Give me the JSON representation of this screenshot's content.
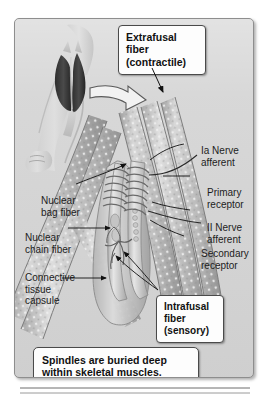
{
  "figure": {
    "background_color": "#d6d6d6",
    "page_color": "#ffffff",
    "border_color": "#8e8e8e"
  },
  "callouts": {
    "extrafusal": {
      "line1": "Extrafusal",
      "line2": "fiber",
      "line3": "(contractile)"
    },
    "intrafusal": {
      "line1": "Intrafusal",
      "line2": "fiber",
      "line3": "(sensory)"
    },
    "caption": {
      "line1": "Spindles are buried deep",
      "line2": "within skeletal muscles."
    }
  },
  "labels": {
    "ia_nerve": {
      "line1": "Ia Nerve",
      "line2": "afferent"
    },
    "primary_receptor": {
      "line1": "Primary",
      "line2": "receptor"
    },
    "ii_nerve": {
      "line1": "II Nerve",
      "line2": "afferent"
    },
    "secondary_receptor": {
      "line1": "Secondary",
      "line2": "receptor"
    },
    "nuclear_bag": {
      "line1": "Nuclear",
      "line2": "bag fiber"
    },
    "nuclear_chain": {
      "line1": "Nuclear",
      "line2": "chain fiber"
    },
    "connective_capsule": {
      "line1": "Connective",
      "line2": "tissue",
      "line3": "capsule"
    }
  },
  "icons": {
    "limb": "arm-muscle-illustration",
    "zoom_arrow": "block-arrow-icon",
    "fibers": "muscle-fiber-bundle-illustration"
  },
  "colors": {
    "fiber_light": "#cfcfcf",
    "fiber_mid": "#ababab",
    "fiber_dark": "#8d8d8d",
    "muscle_dark": "#3a3a3a",
    "leader_line": "#1a1a1a",
    "callout_fill": "#fdfdfd",
    "callout_border": "#4a4a4a"
  }
}
